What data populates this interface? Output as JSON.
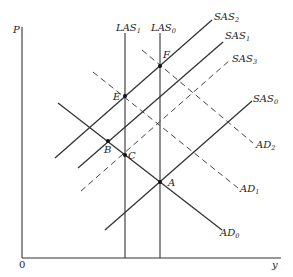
{
  "diagram": {
    "title": "",
    "axes": {
      "y_axis_label": "P",
      "x_axis_label": "y",
      "origin_label": "0"
    },
    "curves": [
      {
        "id": "LAS1",
        "name": "LAS",
        "sub": "1",
        "style": "solid",
        "type": "vertical"
      },
      {
        "id": "LAS0",
        "name": "LAS",
        "sub": "0",
        "style": "solid",
        "type": "vertical"
      },
      {
        "id": "SAS2",
        "name": "SAS",
        "sub": "2",
        "style": "solid",
        "type": "upward"
      },
      {
        "id": "SAS1",
        "name": "SAS",
        "sub": "1",
        "style": "solid",
        "type": "upward"
      },
      {
        "id": "SAS3",
        "name": "SAS",
        "sub": "3",
        "style": "dashed",
        "type": "upward"
      },
      {
        "id": "SAS0",
        "name": "SAS",
        "sub": "0",
        "style": "solid",
        "type": "upward"
      },
      {
        "id": "AD2",
        "name": "AD",
        "sub": "2",
        "style": "dashed",
        "type": "downward"
      },
      {
        "id": "AD1",
        "name": "AD",
        "sub": "1",
        "style": "dashed",
        "type": "downward"
      },
      {
        "id": "AD0",
        "name": "AD",
        "sub": "0",
        "style": "solid",
        "type": "downward"
      }
    ],
    "points": [
      {
        "label": "A",
        "desc": "AD0 ∩ SAS0 ∩ LAS0"
      },
      {
        "label": "B",
        "desc": "AD0 ∩ SAS1"
      },
      {
        "label": "C",
        "desc": "AD0 ∩ LAS1"
      },
      {
        "label": "E",
        "desc": "AD1 ∩ SAS2 ∩ LAS1"
      },
      {
        "label": "F",
        "desc": "AD2 ∩ SAS2 ∩ LAS0"
      }
    ],
    "colors": {
      "ink": "#222222",
      "background": "#ffffff"
    }
  }
}
